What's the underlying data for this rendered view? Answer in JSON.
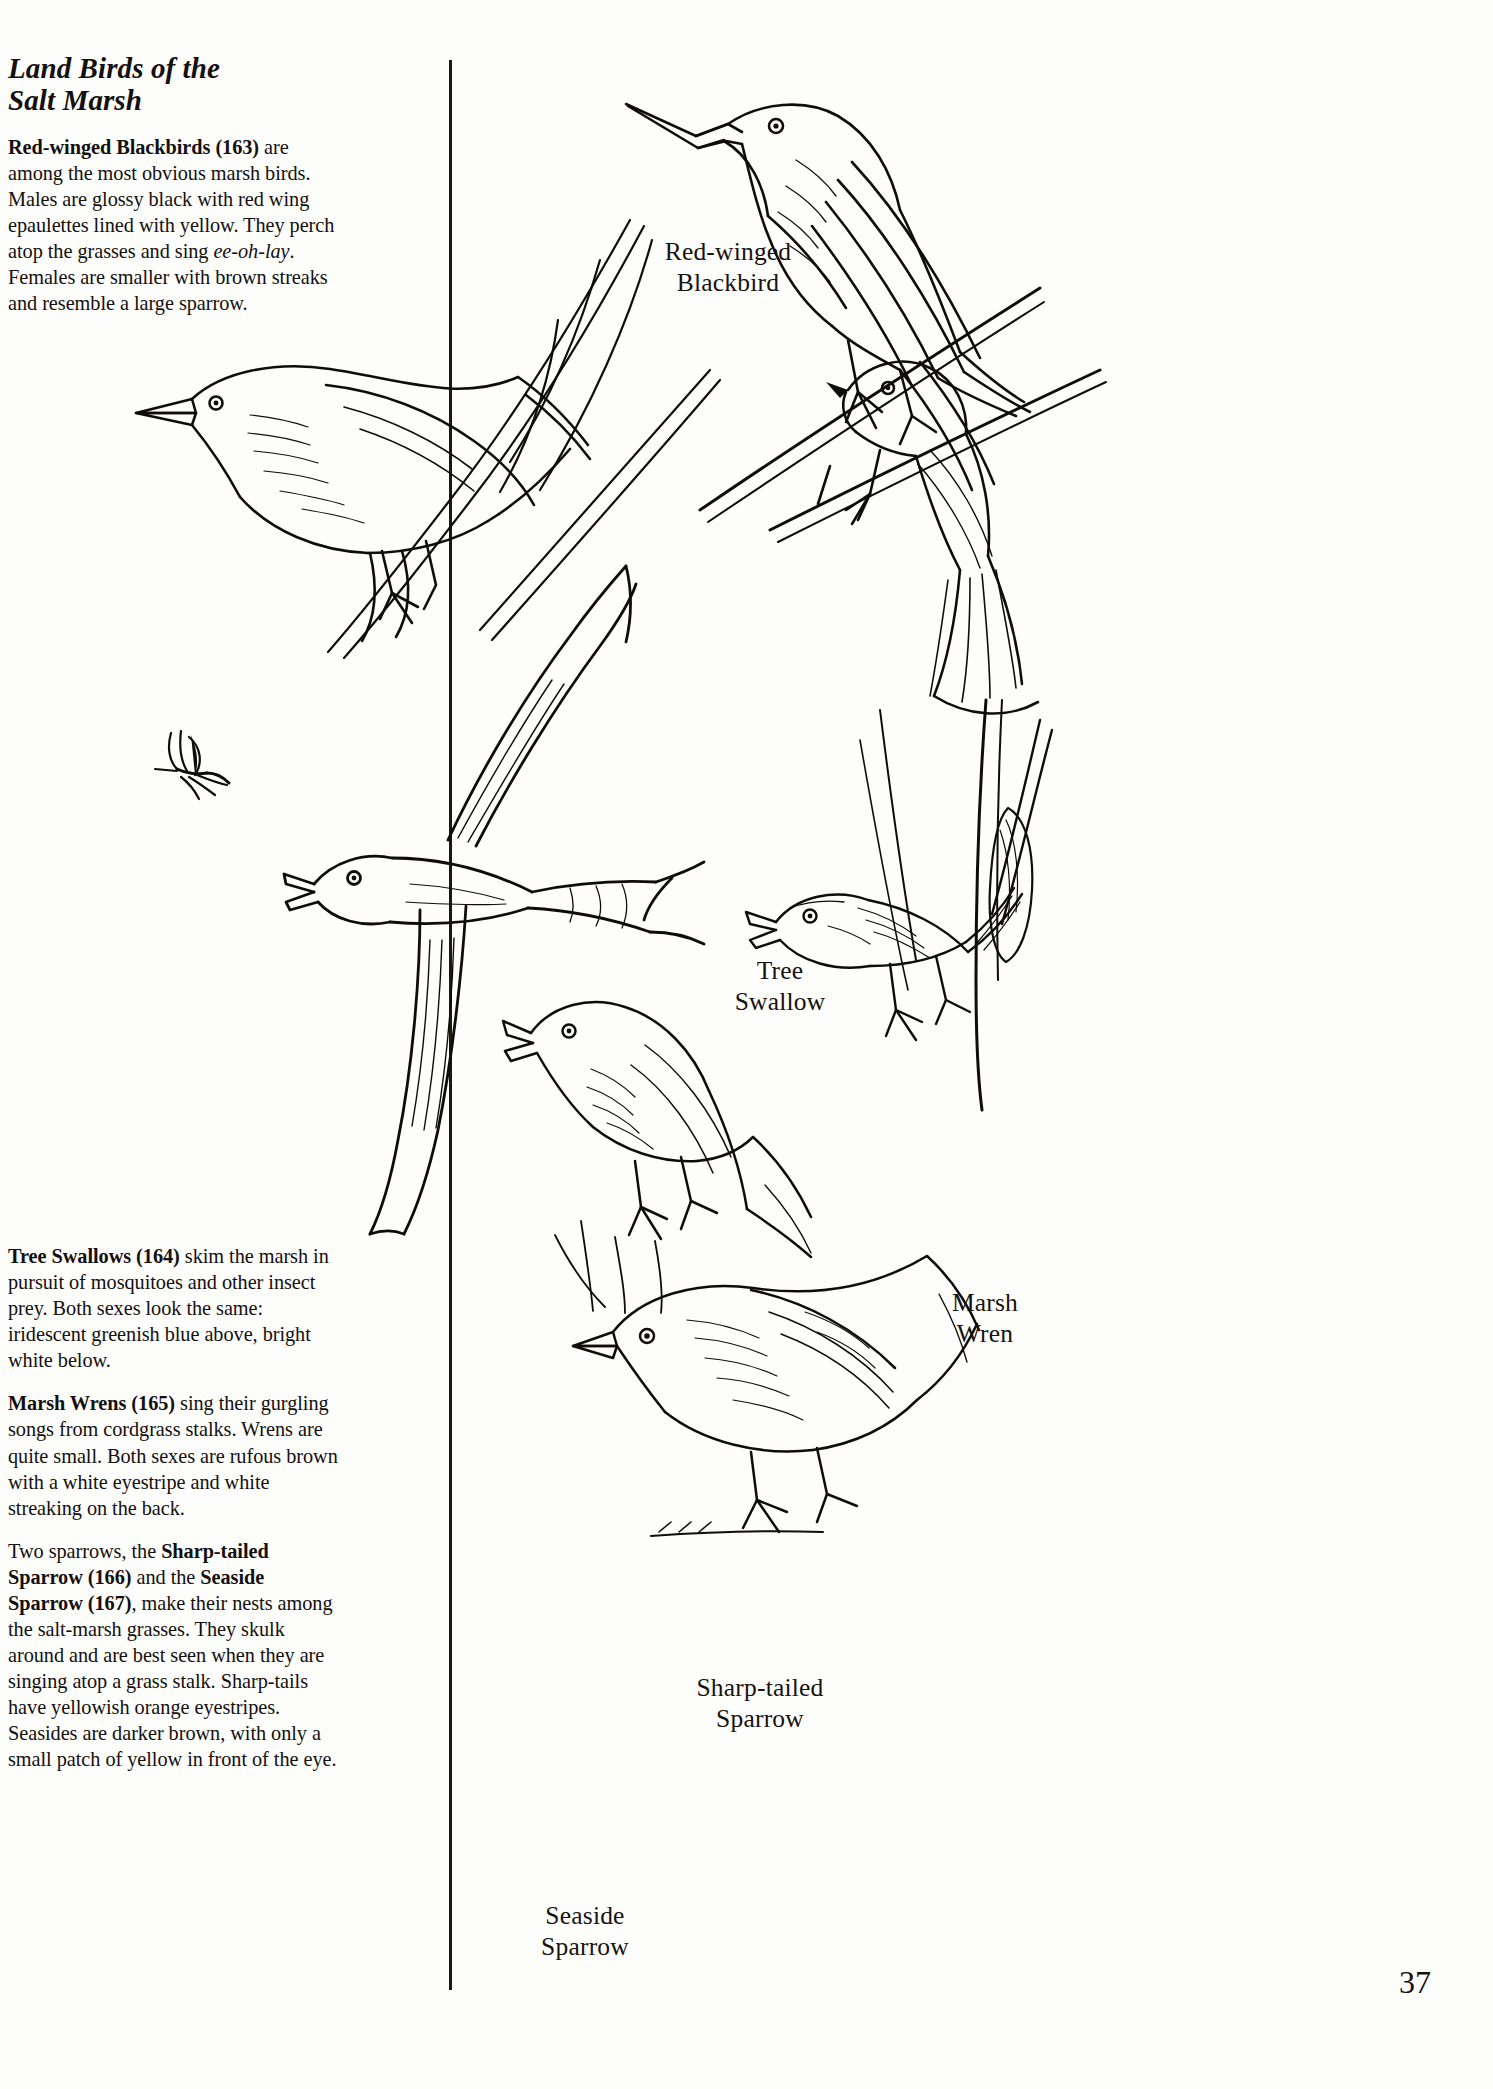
{
  "page": {
    "number": "37",
    "title_line1": "Land Birds of the",
    "title_line2": "Salt Marsh"
  },
  "text_column": {
    "paragraphs": [
      {
        "id": "red-winged-blackbird",
        "lead_bold": "Red-winged Blackbirds (163)",
        "body_before_italic": " are among the most obvious marsh birds. Males are glossy black with red wing epaulettes lined with yellow. They perch atop the grasses and sing ",
        "italic": "ee-oh-lay",
        "body_after_italic": ". Females are smaller with brown streaks and resemble a large sparrow."
      },
      {
        "id": "tree-swallow",
        "lead_bold": "Tree Swallows (164)",
        "body": " skim the marsh in pursuit of mosquitoes and other insect prey. Both sexes look the same: iridescent greenish blue above, bright white below."
      },
      {
        "id": "marsh-wren",
        "lead_bold": "Marsh Wrens (165)",
        "body": " sing their gurgling songs from cordgrass stalks. Wrens are quite small. Both sexes are rufous brown with a white eyestripe and white streaking on the back."
      },
      {
        "id": "sparrows",
        "intro": "Two sparrows, the ",
        "bold_a": "Sharp-tailed Sparrow (166)",
        "mid": " and the ",
        "bold_b": "Seaside Sparrow (167)",
        "tail": ", make their nests among the salt-marsh grasses. They skulk around and are best seen when they are singing atop a grass stalk. Sharp-tails have yellowish orange eyestripes. Seasides are darker brown, with only a small patch of yellow in front of the eye."
      }
    ]
  },
  "illustrations": {
    "red_winged_blackbird": {
      "line1": "Red-winged",
      "line2": "Blackbird"
    },
    "tree_swallow": {
      "line1": "Tree",
      "line2": "Swallow"
    },
    "marsh_wren": {
      "line1": "Marsh",
      "line2": "Wren"
    },
    "sharp_tailed_sparrow": {
      "line1": "Sharp-tailed",
      "line2": "Sparrow"
    },
    "seaside_sparrow": {
      "line1": "Seaside",
      "line2": "Sparrow"
    }
  },
  "colors": {
    "ink": "#100c09",
    "paper": "#fdfdfb"
  }
}
